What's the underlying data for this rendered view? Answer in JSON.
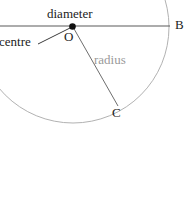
{
  "figure": {
    "kind": "geometry-diagram",
    "background_color": "#ffffff"
  },
  "labels": {
    "diameter": "diameter",
    "centre": "centre",
    "centre_point": "O",
    "radius": "radius",
    "point_b": "B",
    "point_c": "C"
  },
  "colors": {
    "circle_stroke": "#b2b2b2",
    "diameter_stroke": "#5a5a5a",
    "radius_stroke": "#6e6e6e",
    "leader_stroke": "#3c3c3c",
    "centre_dot": "#111111",
    "text_dark": "#1c1c1c",
    "text_gray": "#9a9a9a"
  },
  "geometry": {
    "centre": {
      "x": 73,
      "y": 27
    },
    "radius_px": 96,
    "diameter_line": {
      "x1": 0,
      "y1": 26,
      "x2": 170,
      "y2": 26
    },
    "radius_line": {
      "x1": 73,
      "y1": 27,
      "x2": 118,
      "y2": 106
    },
    "leader_line": {
      "x1": 38,
      "y1": 44,
      "x2": 70,
      "y2": 28
    },
    "point_b": {
      "x": 169,
      "y": 27
    },
    "point_c": {
      "x": 118,
      "y": 106
    }
  }
}
